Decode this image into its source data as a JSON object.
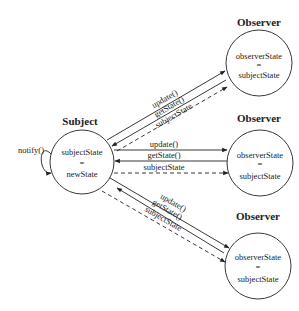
{
  "subject": {
    "title": "Subject",
    "state_line1": "subjectState",
    "state_eq": "=",
    "state_line2": "newState",
    "self_call": "notify()"
  },
  "observers": [
    {
      "title": "Observer",
      "state_line1": "observerState",
      "state_eq": "=",
      "state_line2": "subjectState"
    },
    {
      "title": "Observer",
      "state_line1": "observerState",
      "state_eq": "=",
      "state_line2": "subjectState"
    },
    {
      "title": "Observer",
      "state_line1": "observerState",
      "state_eq": "=",
      "state_line2": "subjectState"
    }
  ],
  "messages": [
    {
      "label": "update()",
      "style": "solid",
      "direction": "subject-to-observer"
    },
    {
      "label": "getState()",
      "style": "solid",
      "direction": "observer-to-subject"
    },
    {
      "label": "subjectState",
      "style": "dashed",
      "direction": "subject-to-observer"
    }
  ],
  "colors": {
    "stroke": "#222222",
    "background": "#ffffff"
  }
}
